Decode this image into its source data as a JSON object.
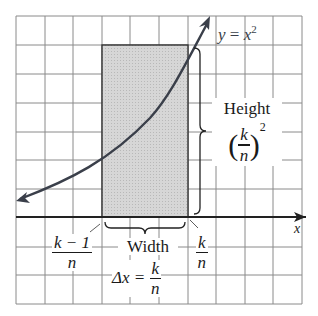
{
  "curve_label": {
    "lhs": "y",
    "eq": " = ",
    "rhs": "x",
    "exp": "2"
  },
  "height_label": {
    "title": "Height",
    "num": "k",
    "den": "n",
    "exp": "2"
  },
  "width_label": {
    "title": "Width",
    "delta": "Δx = ",
    "num": "k",
    "den": "n"
  },
  "left_tick": {
    "num": "k − 1",
    "den": "n"
  },
  "right_tick": {
    "num": "k",
    "den": "n"
  },
  "axis_label": "x",
  "colors": {
    "grid": "#7a7a7a",
    "curve": "#3a3f4a",
    "rect_fill": "#d2d2d2",
    "rect_stroke": "#333333",
    "axis": "#222222"
  }
}
